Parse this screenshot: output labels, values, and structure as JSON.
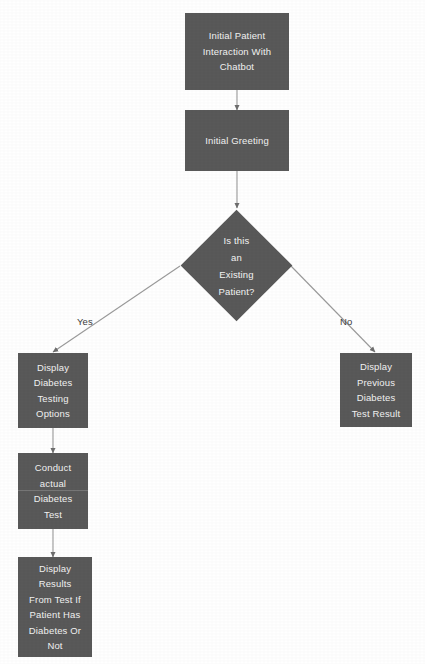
{
  "diagram": {
    "background_color": "#ffffff",
    "node_fill_color": "#595959",
    "node_text_color": "#f2f2f2",
    "connector_color": "#808080",
    "edge_label_color": "#3d3d3d",
    "nodes": [
      {
        "id": "initial-patient-interaction",
        "shape": "process",
        "label": "Initial Patient\nInteraction With\nChatbot"
      },
      {
        "id": "initial-greeting",
        "shape": "process",
        "label": "Initial Greeting"
      },
      {
        "id": "is-existing-patient",
        "shape": "decision",
        "label": "Is this\nan\nExisting\nPatient?"
      },
      {
        "id": "display-diabetes-testing-options",
        "shape": "process",
        "label": "Display\nDiabetes\nTesting\nOptions"
      },
      {
        "id": "display-previous-diabetes-test-result",
        "shape": "process",
        "label": "Display\nPrevious\nDiabetes\nTest Result"
      },
      {
        "id": "conduct-actual-diabetes-test",
        "shape": "process",
        "label": "Conduct\nactual\nDiabetes\nTest"
      },
      {
        "id": "display-results-from-test",
        "shape": "process",
        "label": "Display\nResults\nFrom Test If\nPatient Has\nDiabetes Or\nNot"
      }
    ],
    "edge_labels": {
      "yes": "Yes",
      "no": "No"
    }
  }
}
